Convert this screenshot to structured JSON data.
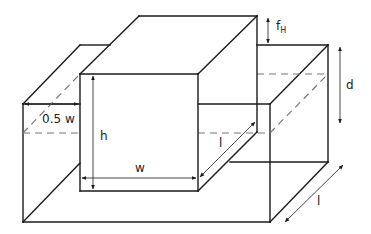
{
  "figure": {
    "type": "isometric schematic",
    "colors": {
      "edge": "#1a1a1a",
      "hidden_edge": "#777777",
      "background": "#ffffff"
    }
  },
  "labels": {
    "half_width": "0.5 w",
    "height": "h",
    "width": "w",
    "length_body": "l",
    "length_tank": "l",
    "depth": "d",
    "freeboard_base": "f",
    "freeboard_sub": "H"
  }
}
